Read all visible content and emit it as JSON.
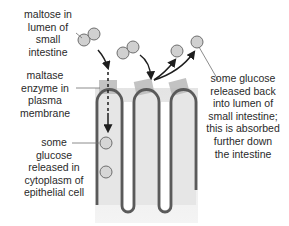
{
  "diagram": {
    "labels": {
      "maltose": "maltose in\nlumen of\nsmall\nintestine",
      "maltase": "maltase\nenzyme in\nplasma\nmembrane",
      "glucose_cytoplasm": "some\nglucose\nreleased in\ncytoplasm of\nepithelial cell",
      "glucose_lumen": "some glucose\nreleased back\ninto lumen of\nsmall intestine;\nthis is absorbed\nfurther down\nthe intestine"
    },
    "colors": {
      "membrane": "#5a5a5a",
      "cell_fill": "#e6e6e6",
      "enzyme": "#bdbdbd",
      "molecule_fill": "#d0d0d0",
      "molecule_stroke": "#6e6e6e",
      "arrow": "#1e1e1e",
      "text": "#2a2a2a"
    },
    "elements": {
      "villi_count": 3,
      "maltose_molecules": 2,
      "glucose_in_lumen": 2,
      "glucose_in_cytoplasm": 2
    }
  }
}
